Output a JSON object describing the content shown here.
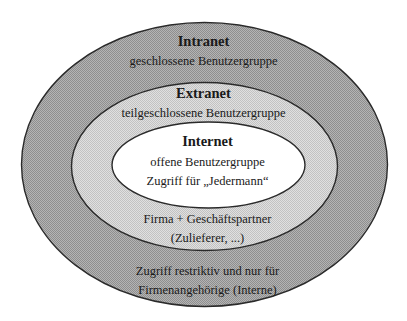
{
  "diagram": {
    "type": "nested-ellipses",
    "colors": {
      "background": "#ffffff",
      "outer_fill": "#a9a9a9",
      "middle_fill": "#d2d2d2",
      "inner_fill": "#ffffff",
      "stroke": "#2a2a2a",
      "text": "#1a1a1a"
    },
    "layers": {
      "intranet": {
        "title": "Intranet",
        "subtitle": "geschlossene Benutzergruppe",
        "note_line1": "Zugriff restriktiv und nur für",
        "note_line2": "Firmenangehörige (Interne)"
      },
      "extranet": {
        "title": "Extranet",
        "subtitle": "teilgeschlossene Benutzergruppe",
        "note_line1": "Firma + Geschäftspartner",
        "note_line2": "(Zulieferer, ...)"
      },
      "internet": {
        "title": "Internet",
        "subtitle": "offene Benutzergruppe",
        "note_line1": "Zugriff für „Jedermann“"
      }
    }
  }
}
